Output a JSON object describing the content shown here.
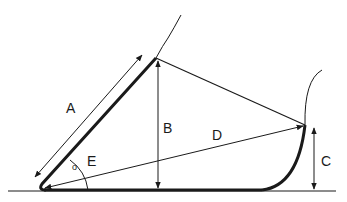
{
  "diagram": {
    "type": "bucket-geometry",
    "labels": {
      "A": "A",
      "B": "B",
      "C": "C",
      "D": "D",
      "E": "E",
      "angle_mark": "o"
    },
    "colors": {
      "stroke": "#1a1a1a",
      "background": "#ffffff"
    }
  }
}
